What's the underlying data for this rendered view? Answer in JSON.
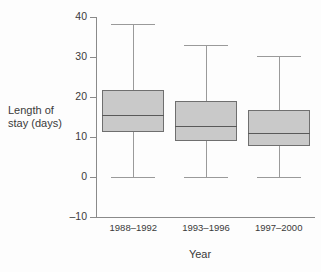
{
  "chart_data": {
    "type": "box",
    "title": "",
    "xlabel": "Year",
    "ylabel": "Length of stay (days)",
    "categories": [
      "1988–1992",
      "1993–1996",
      "1997–2000"
    ],
    "ylim": [
      -10,
      40
    ],
    "yticks": [
      40,
      30,
      20,
      10,
      0,
      -10
    ],
    "ytick_labels": [
      "40",
      "30",
      "20",
      "10",
      "0",
      "–10"
    ],
    "grid": false,
    "legend": "none",
    "box_fill_color": "#c9c9c9",
    "box_edge_color": "#6f6f6f",
    "whisker_color": "#9a9a9a",
    "median_color": "#595959",
    "boxes": [
      {
        "category": "1988–1992",
        "whisker_low": 0,
        "q1": 11.3,
        "median": 15.5,
        "q3": 21.8,
        "whisker_high": 38.2
      },
      {
        "category": "1993–1996",
        "whisker_low": 0,
        "q1": 9.0,
        "median": 12.8,
        "q3": 19.0,
        "whisker_high": 33.0
      },
      {
        "category": "1997–2000",
        "whisker_low": 0,
        "q1": 7.8,
        "median": 11.0,
        "q3": 16.8,
        "whisker_high": 30.2
      }
    ]
  },
  "axis": {
    "ylabel_line1": "Length of",
    "ylabel_line2": "stay (days)",
    "xlabel": "Year"
  }
}
